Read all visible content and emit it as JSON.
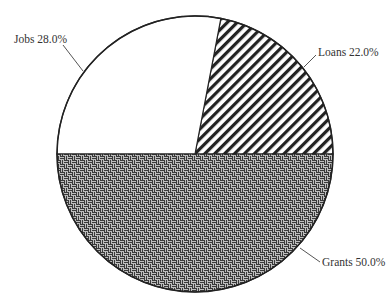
{
  "chart_data": {
    "type": "pie",
    "title": "",
    "categories": [
      "Loans",
      "Jobs",
      "Grants"
    ],
    "values": [
      22.0,
      28.0,
      50.0
    ],
    "unit": "%",
    "labels": [
      "Loans 22.0%",
      "Jobs 28.0%",
      "Grants 50.0%"
    ],
    "slices": [
      {
        "name": "Loans",
        "value": 22.0,
        "label": "Loans 22.0%",
        "pattern": "diagonal-hatch",
        "color": "#222222"
      },
      {
        "name": "Jobs",
        "value": 28.0,
        "label": "Jobs 28.0%",
        "pattern": "none",
        "color": "#ffffff"
      },
      {
        "name": "Grants",
        "value": 50.0,
        "label": "Grants 50.0%",
        "pattern": "basket-weave",
        "color": "#333333"
      }
    ],
    "start_angle_deg": 0,
    "direction": "counter-clockwise",
    "legend": "none",
    "label_style": "outside-with-leader-lines"
  },
  "colors": {
    "outline": "#222222",
    "hatch": "#222222",
    "weave_dark": "#333333",
    "weave_light": "#cccccc",
    "label_text": "#333333",
    "leader_line": "#555555"
  }
}
